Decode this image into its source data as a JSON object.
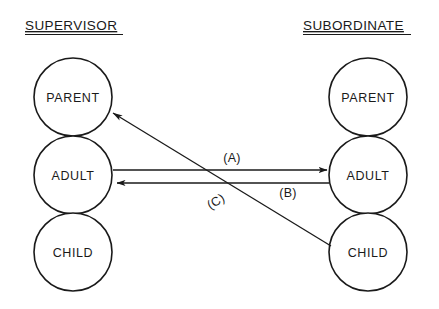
{
  "diagram": {
    "title_left": "SUPERVISOR",
    "title_right": "SUBORDINATE",
    "columns": [
      {
        "role": "supervisor",
        "states": [
          {
            "label": "PARENT"
          },
          {
            "label": "ADULT"
          },
          {
            "label": "CHILD"
          }
        ]
      },
      {
        "role": "subordinate",
        "states": [
          {
            "label": "PARENT"
          },
          {
            "label": "ADULT"
          },
          {
            "label": "CHILD"
          }
        ]
      }
    ],
    "transactions": [
      {
        "id": "A",
        "label": "(A)",
        "from": "supervisor-adult",
        "to": "subordinate-adult",
        "direction": "left-to-right"
      },
      {
        "id": "B",
        "label": "(B)",
        "from": "subordinate-adult",
        "to": "supervisor-adult",
        "direction": "right-to-left"
      },
      {
        "id": "C",
        "label": "(C)",
        "from": "subordinate-child",
        "to": "supervisor-parent",
        "direction": "diagonal-up-left"
      }
    ],
    "colors": {
      "ink": "#1a1a1a",
      "background": "#ffffff"
    }
  }
}
